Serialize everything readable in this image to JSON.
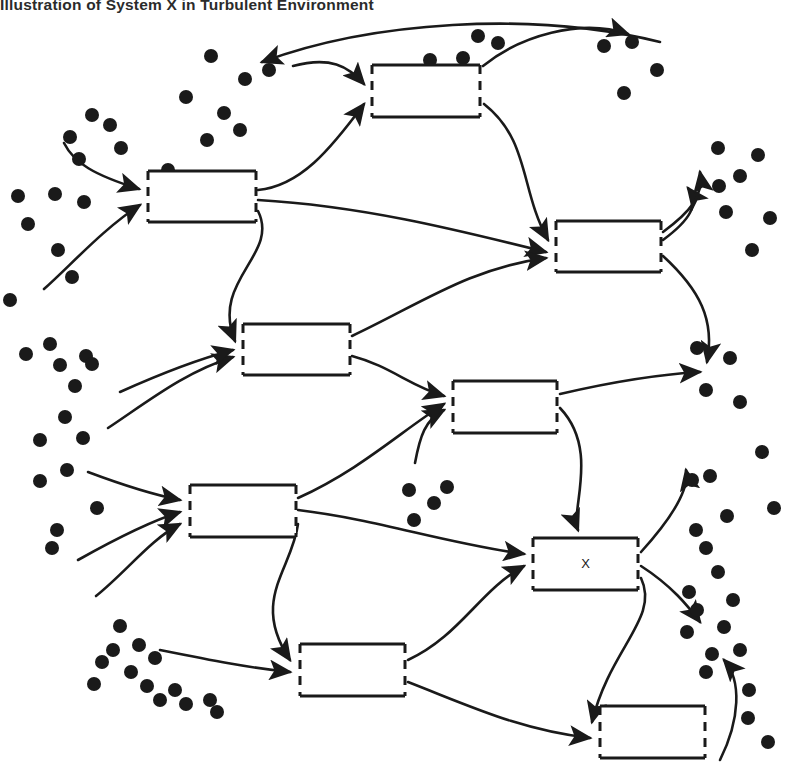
{
  "figure": {
    "title": "Illustration of System X in Turbulent Environment",
    "type": "diagram",
    "diagram_kind": "open-systems-in-turbulent-environment",
    "canvas": {
      "width": 788,
      "height": 778
    },
    "colors": {
      "background": "#ffffff",
      "stroke": "#1a1a1a",
      "dot": "#1a1a1a",
      "title_text": "#2b2b2b"
    },
    "style_notes": {
      "box_style": "rectangle with dashed (gapped) left and right edges denoting permeable boundaries",
      "arrow_style": "curved line with solid filled arrowhead",
      "dot_style": "solid black filled circles representing turbulent environment elements"
    }
  },
  "boxes": [
    {
      "id": "box-1",
      "label": "",
      "x": 372,
      "y": 65,
      "w": 108,
      "h": 52
    },
    {
      "id": "box-2",
      "label": "",
      "x": 148,
      "y": 171,
      "w": 108,
      "h": 51
    },
    {
      "id": "box-3",
      "label": "",
      "x": 556,
      "y": 221,
      "w": 105,
      "h": 51
    },
    {
      "id": "box-4",
      "label": "",
      "x": 243,
      "y": 324,
      "w": 107,
      "h": 51
    },
    {
      "id": "box-5",
      "label": "",
      "x": 453,
      "y": 381,
      "w": 104,
      "h": 52
    },
    {
      "id": "box-6",
      "label": "",
      "x": 190,
      "y": 485,
      "w": 106,
      "h": 52
    },
    {
      "id": "box-7",
      "label": "X",
      "x": 533,
      "y": 538,
      "w": 105,
      "h": 52
    },
    {
      "id": "box-8",
      "label": "",
      "x": 300,
      "y": 644,
      "w": 105,
      "h": 52
    },
    {
      "id": "box-9",
      "label": "",
      "x": 600,
      "y": 706,
      "w": 105,
      "h": 52
    }
  ],
  "arrows": [
    {
      "id": "a01",
      "from": "environment-left",
      "to": "box-2",
      "d": "M 64 143 C 74 163 94 175 139 189"
    },
    {
      "id": "a02",
      "from": "environment-left",
      "to": "box-2",
      "d": "M 44 289 C 70 266 104 228 140 205"
    },
    {
      "id": "a03",
      "from": "environment-top",
      "to": "box-1",
      "d": "M 293 66 C 330 56 348 66 364 84"
    },
    {
      "id": "a04",
      "from": "box-2",
      "to": "box-1",
      "d": "M 258 190 C 300 186 330 150 364 104"
    },
    {
      "id": "a05",
      "from": "box-1",
      "to": "environment-top",
      "d": "M 483 66 C 520 36 580 18 628 34"
    },
    {
      "id": "a06",
      "from": "environment-top-r",
      "to": "environment-top-l",
      "d": "M 660 42 C 530 10 370 22 262 62"
    },
    {
      "id": "a07",
      "from": "box-1",
      "to": "box-3",
      "d": "M 484 104 C 530 140 520 190 548 240"
    },
    {
      "id": "a08",
      "from": "box-2",
      "to": "box-3",
      "d": "M 258 200 C 360 206 450 228 546 252"
    },
    {
      "id": "a09",
      "from": "box-2",
      "to": "box-4",
      "d": "M 258 211 C 280 255 210 280 235 341"
    },
    {
      "id": "a10",
      "from": "box-3",
      "to": "environment-right",
      "d": "M 663 240 C 690 220 700 204 688 188"
    },
    {
      "id": "a11",
      "from": "box-3",
      "to": "environment-right",
      "d": "M 663 256 C 700 290 715 320 707 362"
    },
    {
      "id": "a12",
      "from": "environment-left",
      "to": "box-4",
      "d": "M 108 428 C 150 400 185 372 233 357"
    },
    {
      "id": "a13",
      "from": "box-4",
      "to": "box-3",
      "d": "M 352 336 C 420 304 470 268 546 258"
    },
    {
      "id": "a14",
      "from": "box-4",
      "to": "box-5",
      "d": "M 352 356 C 390 366 410 386 444 396"
    },
    {
      "id": "a15",
      "from": "environment-mid",
      "to": "box-5",
      "d": "M 415 463 C 420 436 425 420 444 410"
    },
    {
      "id": "a16",
      "from": "box-6",
      "to": "box-5",
      "d": "M 298 498 C 360 470 400 432 444 404"
    },
    {
      "id": "a17",
      "from": "box-5",
      "to": "environment-right",
      "d": "M 560 394 C 620 380 665 374 700 372"
    },
    {
      "id": "a18",
      "from": "environment-left",
      "to": "box-6",
      "d": "M 88 472 C 120 484 150 494 180 500"
    },
    {
      "id": "a19",
      "from": "environment-left",
      "to": "box-6",
      "d": "M 78 560 C 110 542 148 522 180 512"
    },
    {
      "id": "a20",
      "from": "environment-left",
      "to": "box-6",
      "d": "M 96 596 C 126 572 150 540 180 524"
    },
    {
      "id": "a21",
      "from": "box-6",
      "to": "box-7",
      "d": "M 298 510 C 380 520 440 542 524 554"
    },
    {
      "id": "a22",
      "from": "box-5",
      "to": "box-7",
      "d": "M 560 408 C 600 450 570 510 578 530"
    },
    {
      "id": "a23",
      "from": "box-6",
      "to": "box-8",
      "d": "M 298 524 C 292 570 250 600 290 660"
    },
    {
      "id": "a24",
      "from": "environment-left",
      "to": "box-8",
      "d": "M 160 650 C 210 660 250 668 290 672"
    },
    {
      "id": "a25",
      "from": "box-8",
      "to": "box-7",
      "d": "M 408 660 C 460 636 480 590 524 566"
    },
    {
      "id": "a26",
      "from": "box-7",
      "to": "environment-right",
      "d": "M 641 552 C 670 520 690 490 686 470"
    },
    {
      "id": "a27",
      "from": "box-7",
      "to": "environment-right",
      "d": "M 641 566 C 672 586 688 606 700 622"
    },
    {
      "id": "a28",
      "from": "box-7",
      "to": "box-9",
      "d": "M 641 578 C 660 618 610 648 592 722"
    },
    {
      "id": "a29",
      "from": "box-8",
      "to": "box-9",
      "d": "M 408 682 C 470 706 520 730 590 738"
    },
    {
      "id": "a30",
      "from": "environment-bottom",
      "to": "environment-right",
      "d": "M 720 760 C 740 720 742 680 724 660"
    },
    {
      "id": "a31",
      "from": "box-3",
      "to": "environment-right",
      "d": "M 663 232 C 690 212 704 196 700 172"
    },
    {
      "id": "a32",
      "from": "environment-left",
      "to": "box-4",
      "d": "M 120 392 C 160 374 195 360 233 350"
    }
  ],
  "environment_dots": {
    "description": "Scattered filled circles depicting the turbulent environment surrounding the systems",
    "radius": 7,
    "count": 88,
    "points": [
      [
        92,
        115
      ],
      [
        70,
        137
      ],
      [
        79,
        159
      ],
      [
        110,
        125
      ],
      [
        121,
        148
      ],
      [
        55,
        194
      ],
      [
        84,
        202
      ],
      [
        58,
        250
      ],
      [
        72,
        277
      ],
      [
        211,
        56
      ],
      [
        245,
        79
      ],
      [
        269,
        70
      ],
      [
        186,
        97
      ],
      [
        224,
        113
      ],
      [
        240,
        130
      ],
      [
        207,
        140
      ],
      [
        478,
        36
      ],
      [
        498,
        43
      ],
      [
        463,
        58
      ],
      [
        604,
        46
      ],
      [
        632,
        42
      ],
      [
        657,
        70
      ],
      [
        624,
        93
      ],
      [
        50,
        344
      ],
      [
        86,
        356
      ],
      [
        26,
        354
      ],
      [
        60,
        365
      ],
      [
        92,
        364
      ],
      [
        75,
        386
      ],
      [
        65,
        417
      ],
      [
        83,
        438
      ],
      [
        40,
        440
      ],
      [
        67,
        470
      ],
      [
        57,
        530
      ],
      [
        97,
        508
      ],
      [
        718,
        148
      ],
      [
        740,
        176
      ],
      [
        719,
        186
      ],
      [
        726,
        212
      ],
      [
        697,
        348
      ],
      [
        730,
        358
      ],
      [
        706,
        390
      ],
      [
        740,
        402
      ],
      [
        692,
        480
      ],
      [
        710,
        476
      ],
      [
        727,
        516
      ],
      [
        696,
        530
      ],
      [
        706,
        548
      ],
      [
        40,
        481
      ],
      [
        52,
        548
      ],
      [
        409,
        490
      ],
      [
        434,
        503
      ],
      [
        447,
        487
      ],
      [
        414,
        520
      ],
      [
        120,
        626
      ],
      [
        139,
        645
      ],
      [
        113,
        650
      ],
      [
        131,
        672
      ],
      [
        102,
        662
      ],
      [
        155,
        658
      ],
      [
        147,
        686
      ],
      [
        160,
        700
      ],
      [
        175,
        690
      ],
      [
        94,
        684
      ],
      [
        186,
        704
      ],
      [
        210,
        700
      ],
      [
        217,
        712
      ],
      [
        689,
        592
      ],
      [
        718,
        572
      ],
      [
        733,
        600
      ],
      [
        697,
        610
      ],
      [
        724,
        627
      ],
      [
        687,
        632
      ],
      [
        712,
        654
      ],
      [
        740,
        650
      ],
      [
        706,
        672
      ],
      [
        749,
        690
      ],
      [
        758,
        155
      ],
      [
        770,
        218
      ],
      [
        752,
        250
      ],
      [
        10,
        300
      ],
      [
        18,
        196
      ],
      [
        28,
        224
      ],
      [
        430,
        60
      ],
      [
        168,
        170
      ],
      [
        762,
        452
      ],
      [
        774,
        508
      ],
      [
        748,
        718
      ],
      [
        768,
        742
      ]
    ]
  },
  "legend": {
    "box_meaning": "System (open, with permeable boundary)",
    "arrow_meaning": "Exchange / transaction flow",
    "dot_meaning": "Turbulent environmental element",
    "focal_system": "X"
  }
}
